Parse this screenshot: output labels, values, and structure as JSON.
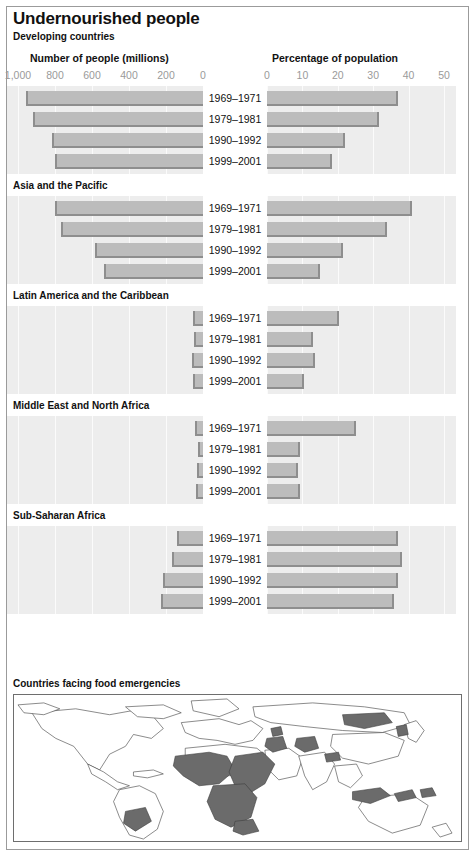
{
  "header": {
    "title": "Undernourished people",
    "subtitle": "Developing countries",
    "left_axis_title": "Number of people (millions)",
    "right_axis_title": "Percentage of population"
  },
  "axes": {
    "left_ticks": [
      "1,000",
      "800",
      "600",
      "400",
      "200",
      "0"
    ],
    "right_ticks": [
      "0",
      "10",
      "20",
      "30",
      "40",
      "50"
    ]
  },
  "map": {
    "caption": "Countries facing food emergencies",
    "highlight_color": "#6b6b6b",
    "base_color": "#ffffff",
    "outline_color": "#3c3c3c"
  },
  "colors": {
    "bar_fill": "#bcbcbc",
    "bar_edge": "#8e8e8e",
    "panel_bg": "#ededed",
    "gridline": "#fbfbfb",
    "tick_text": "#9a9a9a",
    "text": "#111111"
  },
  "chart_data": {
    "type": "bar",
    "title": "Undernourished people",
    "subtitle": "Developing countries",
    "orientation": "horizontal-diverging",
    "categories": [
      "1969–1971",
      "1979–1981",
      "1990–1992",
      "1999–2001"
    ],
    "left_panel": {
      "label": "Number of people (millions)",
      "axis_ticks": [
        1000,
        800,
        600,
        400,
        200,
        0
      ],
      "axis_range": [
        1000,
        0
      ],
      "direction": "right-to-left",
      "unit": "millions"
    },
    "right_panel": {
      "label": "Percentage of population",
      "axis_ticks": [
        0,
        10,
        20,
        30,
        40,
        50
      ],
      "axis_range": [
        0,
        50
      ],
      "direction": "left-to-right",
      "unit": "percent"
    },
    "grid": true,
    "legend": "none",
    "groups": [
      {
        "name": "Developing countries",
        "show_name": false,
        "rows": [
          {
            "period": "1969–1971",
            "millions": 959,
            "percent": 37
          },
          {
            "period": "1979–1981",
            "millions": 919,
            "percent": 31.5
          },
          {
            "period": "1990–1992",
            "millions": 816,
            "percent": 22
          },
          {
            "period": "1999–2001",
            "millions": 798,
            "percent": 18.5
          }
        ]
      },
      {
        "name": "Asia and the Pacific",
        "show_name": true,
        "rows": [
          {
            "period": "1969–1971",
            "millions": 800,
            "percent": 41
          },
          {
            "period": "1979–1981",
            "millions": 768,
            "percent": 34
          },
          {
            "period": "1990–1992",
            "millions": 584,
            "percent": 21.5
          },
          {
            "period": "1999–2001",
            "millions": 535,
            "percent": 15
          }
        ]
      },
      {
        "name": "Latin America and the Caribbean",
        "show_name": true,
        "rows": [
          {
            "period": "1969–1971",
            "millions": 54,
            "percent": 20.3
          },
          {
            "period": "1979–1981",
            "millions": 46,
            "percent": 13
          },
          {
            "period": "1990–1992",
            "millions": 59,
            "percent": 13.5
          },
          {
            "period": "1999–2001",
            "millions": 54,
            "percent": 10.5
          }
        ]
      },
      {
        "name": "Middle East and North Africa",
        "show_name": true,
        "rows": [
          {
            "period": "1969–1971",
            "millions": 45,
            "percent": 25
          },
          {
            "period": "1979–1981",
            "millions": 26,
            "percent": 9.3
          },
          {
            "period": "1990–1992",
            "millions": 31,
            "percent": 8.8
          },
          {
            "period": "1999–2001",
            "millions": 40,
            "percent": 9.3
          }
        ]
      },
      {
        "name": "Sub-Saharan Africa",
        "show_name": true,
        "rows": [
          {
            "period": "1969–1971",
            "millions": 140,
            "percent": 37
          },
          {
            "period": "1979–1981",
            "millions": 168,
            "percent": 38
          },
          {
            "period": "1990–1992",
            "millions": 216,
            "percent": 37
          },
          {
            "period": "1999–2001",
            "millions": 227,
            "percent": 36
          }
        ]
      }
    ]
  }
}
